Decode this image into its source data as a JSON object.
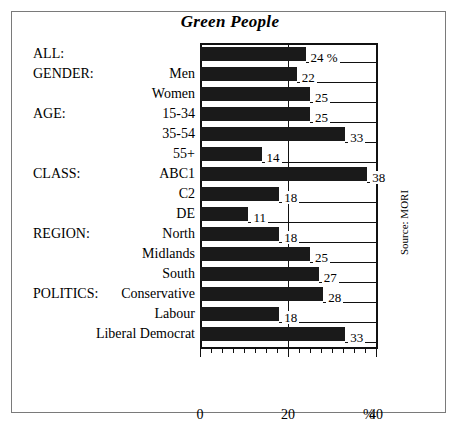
{
  "figure": {
    "title": "Green People",
    "source_note": "Source: MORI",
    "percent_symbol": "%"
  },
  "chart_data": {
    "type": "bar",
    "orientation": "horizontal",
    "title": "Green People",
    "xlabel": "%",
    "ylabel": "",
    "xlim": [
      0,
      40
    ],
    "xticks": [
      0,
      20,
      40
    ],
    "xtick_labels": [
      "0",
      "20",
      "40"
    ],
    "minor_tick_step": 2.5,
    "grid": "single vertical gridline at 20",
    "legend": "none",
    "annotation": "Source: MORI",
    "unit_suffix_first_bar": "%",
    "groups": [
      {
        "label": "ALL:",
        "row_index": 0
      },
      {
        "label": "GENDER:",
        "row_index": 1
      },
      {
        "label": "AGE:",
        "row_index": 3
      },
      {
        "label": "CLASS:",
        "row_index": 6
      },
      {
        "label": "REGION:",
        "row_index": 9
      },
      {
        "label": "POLITICS:",
        "row_index": 12
      }
    ],
    "categories": [
      "",
      "Men",
      "Women",
      "15-34",
      "35-54",
      "55+",
      "ABC1",
      "C2",
      "DE",
      "North",
      "Midlands",
      "South",
      "Conservative",
      "Labour",
      "Liberal Democrat"
    ],
    "rows": [
      {
        "group": "ALL:",
        "category": "",
        "value": 24,
        "label": "24 %"
      },
      {
        "group": "GENDER:",
        "category": "Men",
        "value": 22,
        "label": "22"
      },
      {
        "group": "",
        "category": "Women",
        "value": 25,
        "label": "25"
      },
      {
        "group": "AGE:",
        "category": "15-34",
        "value": 25,
        "label": "25"
      },
      {
        "group": "",
        "category": "35-54",
        "value": 33,
        "label": "33"
      },
      {
        "group": "",
        "category": "55+",
        "value": 14,
        "label": "14"
      },
      {
        "group": "CLASS:",
        "category": "ABC1",
        "value": 38,
        "label": "38"
      },
      {
        "group": "",
        "category": "C2",
        "value": 18,
        "label": "18"
      },
      {
        "group": "",
        "category": "DE",
        "value": 11,
        "label": "11"
      },
      {
        "group": "REGION:",
        "category": "North",
        "value": 18,
        "label": "18"
      },
      {
        "group": "",
        "category": "Midlands",
        "value": 25,
        "label": "25"
      },
      {
        "group": "",
        "category": "South",
        "value": 27,
        "label": "27"
      },
      {
        "group": "POLITICS:",
        "category": "Conservative",
        "value": 28,
        "label": "28"
      },
      {
        "group": "",
        "category": "Labour",
        "value": 18,
        "label": "18"
      },
      {
        "group": "",
        "category": "Liberal Democrat",
        "value": 33,
        "label": "33"
      }
    ]
  }
}
